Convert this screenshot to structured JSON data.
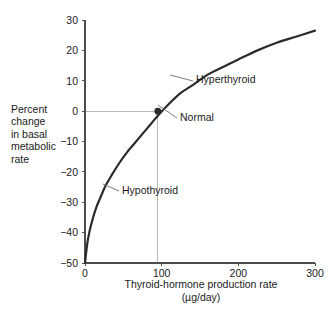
{
  "chart_data": {
    "type": "line",
    "title": "",
    "xlabel": "Thyroid-hormone production rate",
    "xlabel_units": "(µg/day)",
    "ylabel_lines": [
      "Percent",
      "change",
      "in basal",
      "metabolic",
      "rate"
    ],
    "xlim": [
      0,
      300
    ],
    "ylim": [
      -50,
      30
    ],
    "xticks": [
      0,
      100,
      200,
      300
    ],
    "yticks": [
      30,
      20,
      10,
      0,
      -10,
      -20,
      -30,
      -40,
      -50
    ],
    "xtick_labels": [
      "0",
      "100",
      "200",
      "300"
    ],
    "ytick_labels": [
      "30",
      "20",
      "10",
      "0",
      "−10",
      "−20",
      "−30",
      "−40",
      "−50"
    ],
    "grid": false,
    "legend": "none",
    "series": [
      {
        "name": "Basal metabolic rate response",
        "color": "#2b2b2b",
        "linewidth": 2.2,
        "x": [
          0,
          3,
          6,
          10,
          15,
          20,
          27,
          35,
          45,
          55,
          65,
          75,
          85,
          95,
          110,
          125,
          140,
          160,
          180,
          200,
          225,
          250,
          275,
          300
        ],
        "y": [
          -50,
          -43.5,
          -39.5,
          -35.5,
          -31.5,
          -28.5,
          -24.5,
          -21,
          -17,
          -13.5,
          -10.5,
          -7.5,
          -4.5,
          -1.5,
          2.5,
          6,
          8.5,
          12,
          14.5,
          17,
          20,
          22.5,
          24.5,
          26.5
        ]
      }
    ],
    "markers": [
      {
        "name": "Normal",
        "x": 95,
        "y": 0,
        "color": "#2b2b2b",
        "radius": 3.4
      }
    ],
    "guide_lines": [
      {
        "name": "normal-horizontal-guide",
        "orientation": "horizontal",
        "value": 0,
        "from": 0,
        "to": 95,
        "color": "#b9b9b9"
      },
      {
        "name": "normal-vertical-guide",
        "orientation": "vertical",
        "value": 95,
        "from": -50,
        "to": 0,
        "color": "#b9b9b9"
      }
    ],
    "annotations": [
      {
        "name": "hyperthyroid",
        "text": "Hyperthyroid",
        "text_x": 196,
        "text_y": 83,
        "leader_from_x": 170,
        "leader_from_y": 75,
        "leader_to_x": 193,
        "leader_to_y": 81
      },
      {
        "name": "normal",
        "text": "Normal",
        "text_x": 180,
        "text_y": 121,
        "leader_from_x": 158,
        "leader_from_y": 105,
        "leader_to_x": 177,
        "leader_to_y": 118
      },
      {
        "name": "hypothyroid",
        "text": "Hypothyroid",
        "text_x": 122,
        "text_y": 194,
        "leader_from_x": 103,
        "leader_from_y": 184,
        "leader_to_x": 119,
        "leader_to_y": 191
      }
    ],
    "colors": {
      "curve": "#2b2b2b",
      "axis": "#4d4d4d",
      "guide": "#b9b9b9",
      "text": "#1a1a1a",
      "background": "#ffffff"
    }
  }
}
